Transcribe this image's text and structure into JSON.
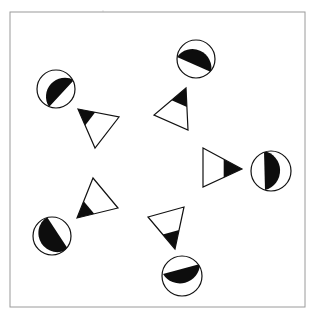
{
  "figure": {
    "width": 311,
    "height": 310,
    "background": "#ffffff",
    "ink": "#111111",
    "fill_light": "#ffffff",
    "fill_dark": "#0d0d0d",
    "frame": {
      "x": 10,
      "y": 12,
      "width": 295,
      "height": 295,
      "stroke": "#9a9a9a",
      "stroke_width": 1
    },
    "speck": {
      "x": 103,
      "y": 11,
      "r": 0.6,
      "color": "#b0b0b0"
    },
    "pairs": [
      {
        "id": "upper-left",
        "circle": {
          "cx": 56,
          "cy": 89,
          "r": 19,
          "chord": [
            [
              74,
              80
            ],
            [
              49,
              107
            ]
          ],
          "dark_side": "lower-right"
        },
        "triangle": {
          "points": [
            [
              78,
              109
            ],
            [
              119,
              117
            ],
            [
              95,
              148
            ]
          ],
          "dark_vertex": 0,
          "dark_fraction": 0.42
        }
      },
      {
        "id": "top-right",
        "circle": {
          "cx": 196,
          "cy": 59,
          "r": 19,
          "chord": [
            [
              177,
              57
            ],
            [
              211,
              72
            ]
          ],
          "dark_side": "bottom"
        },
        "triangle": {
          "points": [
            [
              186,
              88
            ],
            [
              154,
              115
            ],
            [
              188,
              130
            ]
          ],
          "dark_vertex": 0,
          "dark_fraction": 0.45
        }
      },
      {
        "id": "right",
        "circle": {
          "cx": 271,
          "cy": 171,
          "r": 20,
          "chord": [
            [
              264,
              151
            ],
            [
              265,
              190
            ]
          ],
          "dark_side": "left"
        },
        "triangle": {
          "points": [
            [
              242,
              169
            ],
            [
              203,
              148
            ],
            [
              203,
              187
            ]
          ],
          "dark_vertex": 0,
          "dark_fraction": 0.47
        }
      },
      {
        "id": "lower-left",
        "circle": {
          "cx": 52,
          "cy": 236,
          "r": 19,
          "chord": [
            [
              47,
              217
            ],
            [
              68,
              249
            ]
          ],
          "dark_side": "upper-right"
        },
        "triangle": {
          "points": [
            [
              77,
              218
            ],
            [
              93,
              178
            ],
            [
              118,
              208
            ]
          ],
          "dark_vertex": 0,
          "dark_fraction": 0.42
        }
      },
      {
        "id": "bottom",
        "circle": {
          "cx": 182,
          "cy": 276,
          "r": 20,
          "chord": [
            [
              163,
              274
            ],
            [
              200,
              264
            ]
          ],
          "dark_side": "top"
        },
        "triangle": {
          "points": [
            [
              175,
              249
            ],
            [
              148,
              217
            ],
            [
              184,
              207
            ]
          ],
          "dark_vertex": 0,
          "dark_fraction": 0.45
        }
      }
    ]
  }
}
